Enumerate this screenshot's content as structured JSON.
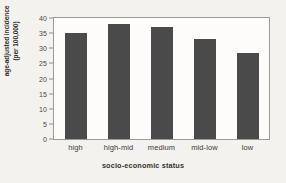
{
  "chart_data": {
    "type": "bar",
    "title": "",
    "subtitle": "",
    "categories": [
      "high",
      "high-mid",
      "medium",
      "mid-low",
      "low"
    ],
    "values": [
      35.2,
      38.0,
      37.0,
      33.0,
      28.6
    ],
    "series": [
      {
        "name": "age-adjusted incidence",
        "values": [
          35.2,
          38.0,
          37.0,
          33.0,
          28.6
        ]
      }
    ],
    "xlabel": "socio-economic status",
    "ylabel": "age-adjusted incidence (per 100,000)",
    "ylabel_line1": "age-adjusted incidence",
    "ylabel_line2": "(per 100,000)",
    "ylim": [
      0,
      40
    ],
    "yticks": [
      0,
      5,
      10,
      15,
      20,
      25,
      30,
      35,
      40
    ],
    "ytick_labels": [
      "0",
      "5",
      "10",
      "15",
      "20",
      "25",
      "30",
      "35",
      "40"
    ],
    "grid": false,
    "legend": false,
    "legend_position": "none",
    "bar_color": "#4a4a4a",
    "plot_background": "#fdfcfa",
    "figure_background": "#f4f2ee",
    "axis_color": "#9a9a96"
  }
}
